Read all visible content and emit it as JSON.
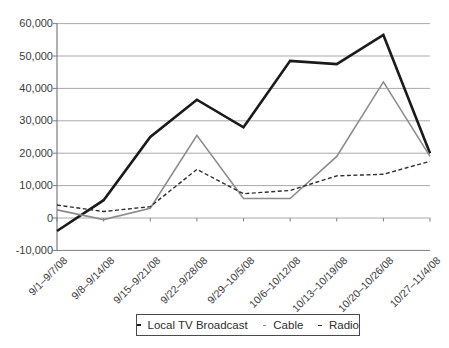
{
  "chart_data": {
    "type": "line",
    "categories": [
      "9/1–9/7/08",
      "9/8–9/14/08",
      "9/15–9/21/08",
      "9/22–9/28/08",
      "9/29–10/5/08",
      "10/6–10/12/08",
      "10/13–10/19/08",
      "10/20–10/26/08",
      "10/27–11/4/08"
    ],
    "series": [
      {
        "name": "Local TV Broadcast",
        "color": "#1a1a1a",
        "stroke_width": 2.6,
        "dash": null,
        "values": [
          -4000,
          5500,
          25000,
          36500,
          28000,
          48500,
          47500,
          56500,
          20000
        ]
      },
      {
        "name": "Cable",
        "color": "#8c8c8c",
        "stroke_width": 1.6,
        "dash": null,
        "values": [
          2500,
          -500,
          3000,
          25500,
          6000,
          6000,
          19000,
          42000,
          19000
        ]
      },
      {
        "name": "Radio",
        "color": "#2e2e2e",
        "stroke_width": 1.4,
        "dash": "4 2.5",
        "values": [
          4000,
          2000,
          3500,
          15000,
          7500,
          8500,
          13000,
          13500,
          17500
        ]
      }
    ],
    "title": "",
    "xlabel": "",
    "ylabel": "",
    "ylim": [
      -10000,
      60000
    ],
    "ytick_step": 10000,
    "ytick_labels": [
      "-10,000",
      "0",
      "10,000",
      "20,000",
      "30,000",
      "40,000",
      "50,000",
      "60,000"
    ],
    "grid": "horizontal",
    "legend_position": "bottom-center",
    "grid_color": "#a9a9a9",
    "axis_color": "#7d7d7d"
  }
}
